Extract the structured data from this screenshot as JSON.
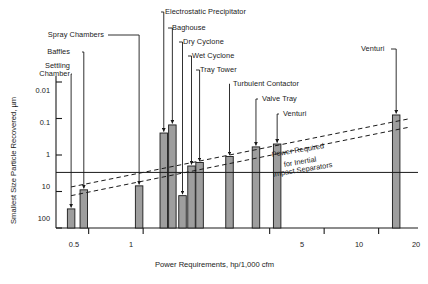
{
  "chart_data": {
    "type": "bar",
    "title": "",
    "xlabel": "Power Requirements, hp/1,000 cfm",
    "ylabel": "Smallest Size Particle Recovered, µm",
    "x_scale": "log",
    "y_scale": "log-inverted",
    "xlim": [
      0.33,
      33
    ],
    "ylim": [
      0.01,
      100
    ],
    "grid": false,
    "legend": "none",
    "x_ticks": [
      "0.5",
      "1",
      "5",
      "10",
      "20"
    ],
    "x_tick_values": [
      0.5,
      1,
      5,
      10,
      20
    ],
    "y_ticks": [
      "0.01",
      "0.1",
      "1",
      "10",
      "100"
    ],
    "y_tick_values": [
      0.01,
      0.1,
      1,
      10,
      100
    ],
    "categories": [
      "Settling Chamber",
      "Baffles",
      "Spray Chambers",
      "Electrostatic Precipitator",
      "Baghouse",
      "Dry Cyclone",
      "Wet Cyclone",
      "Tray Tower",
      "Turbulent Contactor",
      "Valve Tray",
      "Venturi",
      "Venturi"
    ],
    "bars": [
      {
        "label": "Settling Chamber",
        "x": 0.4,
        "top_um": 30.0
      },
      {
        "label": "Baffles",
        "x": 0.47,
        "top_um": 9.0
      },
      {
        "label": "Spray Chambers",
        "x": 0.95,
        "top_um": 7.0
      },
      {
        "label": "Electrostatic Precipitator",
        "x": 1.3,
        "top_um": 0.25
      },
      {
        "label": "Baghouse",
        "x": 1.45,
        "top_um": 0.15
      },
      {
        "label": "Dry Cyclone",
        "x": 1.65,
        "top_um": 13.0
      },
      {
        "label": "Wet Cyclone",
        "x": 1.85,
        "top_um": 2.0
      },
      {
        "label": "Tray Tower",
        "x": 2.05,
        "top_um": 1.6
      },
      {
        "label": "Turbulent Contactor",
        "x": 3.0,
        "top_um": 1.1
      },
      {
        "label": "Valve Tray",
        "x": 4.2,
        "top_um": 0.6
      },
      {
        "label": "Venturi",
        "x": 5.5,
        "top_um": 0.5
      },
      {
        "label": "Venturi",
        "x": 25.0,
        "top_um": 0.08
      }
    ],
    "reference_line": {
      "type": "horizontal",
      "y_um": 3.0
    },
    "trend_lines": [
      {
        "style": "dashed",
        "points": [
          [
            0.4,
            7.5
          ],
          [
            30.0,
            0.1
          ]
        ]
      },
      {
        "style": "dashed",
        "points": [
          [
            0.4,
            13.0
          ],
          [
            30.0,
            0.17
          ]
        ]
      }
    ],
    "annotation": {
      "line1": "Power Required",
      "line2": "for Inertial",
      "line3": "Impact Separators"
    },
    "callouts": [
      {
        "label": "Settling Chamber",
        "multiline": [
          "Settling",
          "Chamber"
        ]
      },
      {
        "label": "Baffles"
      },
      {
        "label": "Spray Chambers"
      },
      {
        "label": "Electrostatic Precipitator"
      },
      {
        "label": "Baghouse"
      },
      {
        "label": "Dry Cyclone"
      },
      {
        "label": "Wet Cyclone"
      },
      {
        "label": "Tray Tower"
      },
      {
        "label": "Turbulent Contactor"
      },
      {
        "label": "Valve Tray"
      },
      {
        "label": "Venturi"
      },
      {
        "label": "Venturi"
      }
    ],
    "colors": {
      "bar_fill": "#9e9e9e",
      "bar_stroke": "#1a1a1a",
      "axis": "#1a1a1a",
      "text": "#1a1a1a",
      "background": "#ffffff"
    }
  },
  "labels": {
    "settling_chamber_1": "Settling",
    "settling_chamber_2": "Chamber",
    "baffles": "Baffles",
    "spray_chambers": "Spray Chambers",
    "electrostatic_precipitator": "Electrostatic Precipitator",
    "baghouse": "Baghouse",
    "dry_cyclone": "Dry Cyclone",
    "wet_cyclone": "Wet Cyclone",
    "tray_tower": "Tray Tower",
    "turbulent_contactor": "Turbulent Contactor",
    "valve_tray": "Valve Tray",
    "venturi_mid": "Venturi",
    "venturi_right": "Venturi"
  },
  "axes": {
    "x_title": "Power Requirements, hp/1,000 cfm",
    "y_title": "Smallest Size Particle Recovered, µm",
    "x_ticks": [
      "0.5",
      "1",
      "5",
      "10",
      "20"
    ],
    "y_ticks": [
      "0.01",
      "0.1",
      "1",
      "10",
      "100"
    ]
  },
  "annotation": {
    "l1": "Power Required",
    "l2": "for Inertial",
    "l3": "Impact Separators"
  }
}
